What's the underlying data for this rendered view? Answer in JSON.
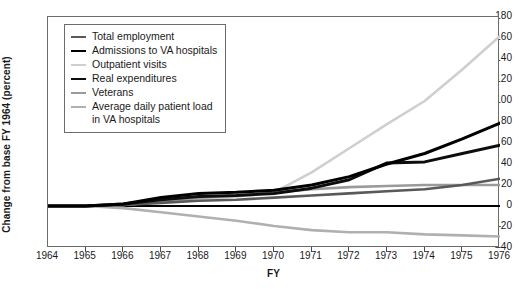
{
  "chart_data": {
    "type": "line",
    "title": "",
    "xlabel": "FY",
    "ylabel": "Change from base FY 1964 (percent)",
    "xlim": [
      1964,
      1976
    ],
    "ylim": [
      -40,
      180
    ],
    "grid": false,
    "legend_position": "upper-left-inside",
    "x": [
      1964,
      1965,
      1966,
      1967,
      1968,
      1969,
      1970,
      1971,
      1972,
      1973,
      1974,
      1975,
      1976
    ],
    "yticks": [
      180,
      160,
      140,
      120,
      100,
      80,
      60,
      40,
      20,
      0,
      -20,
      -40
    ],
    "xticks": [
      "1964",
      "1965",
      "1966",
      "1967",
      "1968",
      "1969",
      "1970",
      "1971",
      "1972",
      "1973",
      "1974",
      "1975",
      "1976"
    ],
    "series": [
      {
        "name": "Total employment",
        "color": "#59595b",
        "width": 2.6,
        "values": [
          0,
          0,
          1,
          3,
          5,
          6,
          8,
          10,
          12,
          14,
          16,
          20,
          26
        ]
      },
      {
        "name": "Admissions to VA hospitals",
        "color": "#000000",
        "width": 3.0,
        "values": [
          0,
          0,
          2,
          8,
          12,
          13,
          15,
          20,
          28,
          40,
          50,
          64,
          79
        ]
      },
      {
        "name": "Outpatient visits",
        "color": "#cfcfcf",
        "width": 2.6,
        "values": [
          0,
          0,
          1,
          4,
          7,
          9,
          13,
          32,
          55,
          78,
          100,
          130,
          162
        ]
      },
      {
        "name": "Real expenditures",
        "color": "#0d0d0d",
        "width": 3.0,
        "values": [
          0,
          0,
          2,
          6,
          9,
          10,
          12,
          17,
          25,
          41,
          42,
          50,
          58
        ]
      },
      {
        "name": "Veterans",
        "color": "#9a9a9a",
        "width": 2.6,
        "values": [
          0,
          0,
          1,
          4,
          8,
          10,
          13,
          16,
          18,
          19,
          20,
          20,
          20
        ]
      },
      {
        "name": "Average daily patient load\nin VA hospitals",
        "color": "#b0b0b0",
        "width": 2.6,
        "values": [
          0,
          0,
          -2,
          -6,
          -10,
          -14,
          -19,
          -23,
          -25,
          -25,
          -27,
          -28,
          -29
        ]
      }
    ]
  },
  "axes": {
    "ylabel": "Change from base FY 1964 (percent)",
    "xlabel": "FY"
  }
}
